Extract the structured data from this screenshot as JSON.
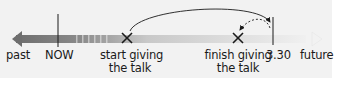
{
  "diagram": {
    "type": "timeline",
    "direction": {
      "left": "past",
      "right": "future"
    },
    "labels": {
      "past": "past",
      "now": "NOW",
      "start_line1": "start giving",
      "start_line2": "the talk",
      "finish_line1": "finish giving",
      "finish_line2": "the talk",
      "time": "3.30",
      "future": "future"
    },
    "markers": [
      {
        "name": "now",
        "kind": "vertical-line"
      },
      {
        "name": "start-giving-the-talk",
        "kind": "cross"
      },
      {
        "name": "finish-giving-the-talk",
        "kind": "cross"
      },
      {
        "name": "3.30",
        "kind": "vertical-line"
      }
    ],
    "arrows": [
      {
        "from": "start-giving-the-talk",
        "to": "3.30",
        "style": "solid-curve"
      },
      {
        "from": "3.30",
        "to": "finish-giving-the-talk",
        "style": "dashed-curve"
      }
    ],
    "colors": {
      "background": "#f2f2f2",
      "timeline_dark": "#6e6e6e",
      "timeline_light": "#e8e8e8",
      "ink": "#1a1a1a"
    }
  }
}
